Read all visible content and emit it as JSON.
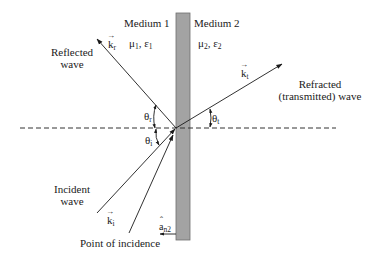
{
  "diagram": {
    "media": [
      {
        "name": "Medium 1",
        "params": {
          "mu": "μ",
          "mu_sub": "1",
          "sep": ", ",
          "eps": "ε",
          "eps_sub": "1"
        }
      },
      {
        "name": "Medium 2",
        "params": {
          "mu": "μ",
          "mu_sub": "2",
          "sep": ", ",
          "eps": "ε",
          "eps_sub": "2"
        }
      }
    ],
    "waves": {
      "reflected": {
        "line1": "Reflected",
        "line2": "wave",
        "vector": "k",
        "vector_sub": "r",
        "angle": "θ",
        "angle_sub": "r"
      },
      "refracted": {
        "line1": "Refracted",
        "line2": "(transmitted) wave",
        "vector": "k",
        "vector_sub": "t",
        "angle": "θ",
        "angle_sub": "t"
      },
      "incident": {
        "line1": "Incident",
        "line2": "wave",
        "vector": "k",
        "vector_sub": "i",
        "angle": "θ",
        "angle_sub": "i"
      }
    },
    "normal_unit_vector": {
      "symbol": "a",
      "sub": "n2"
    },
    "point_of_incidence_label": "Point of incidence",
    "colors": {
      "slab_fill": "#a3a3a3",
      "slab_stroke": "#6e6e6e",
      "line": "#1a1a1a",
      "dashed": "#333333"
    }
  }
}
